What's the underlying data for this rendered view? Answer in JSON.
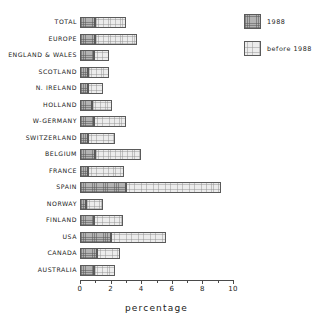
{
  "chart_data": {
    "type": "bar",
    "orientation": "horizontal",
    "stacked": true,
    "title": "",
    "subtitle": "",
    "xlabel": "percentage",
    "ylabel": "",
    "xlim": [
      0,
      10
    ],
    "ylim": null,
    "grid": false,
    "legend_position": "top-right",
    "x_major_ticks": [
      0,
      2,
      4,
      6,
      8,
      10
    ],
    "x_minor_ticks": [
      1,
      3,
      5,
      7,
      9
    ],
    "x_tick_labels": [
      "0",
      "2",
      "4",
      "6",
      "8",
      "10"
    ],
    "categories": [
      "TOTAL",
      "EUROPE",
      "ENGLAND & WALES",
      "SCOTLAND",
      "N. IRELAND",
      "HOLLAND",
      "W-GERMANY",
      "SWITZERLAND",
      "BELGIUM",
      "FRANCE",
      "SPAIN",
      "NORWAY",
      "FINLAND",
      "USA",
      "CANADA",
      "AUSTRALIA"
    ],
    "series": [
      {
        "name": "1988",
        "color": "#b3b3b3",
        "values": [
          1.0,
          1.0,
          0.9,
          0.5,
          0.5,
          0.8,
          0.9,
          0.5,
          1.0,
          0.5,
          3.0,
          0.4,
          0.9,
          2.0,
          1.1,
          0.9
        ]
      },
      {
        "name": "before 1988",
        "color": "#ececec",
        "values": [
          2.0,
          2.7,
          1.0,
          1.4,
          1.0,
          1.3,
          2.1,
          1.8,
          3.0,
          2.4,
          6.2,
          1.1,
          1.9,
          3.6,
          1.5,
          1.4
        ]
      }
    ],
    "totals": [
      3.0,
      3.7,
      1.9,
      1.9,
      1.5,
      2.1,
      3.0,
      2.3,
      4.0,
      2.9,
      9.2,
      1.5,
      2.8,
      5.6,
      2.6,
      2.3
    ]
  },
  "legend": {
    "entries": [
      {
        "label": "1988",
        "swatch": "recent"
      },
      {
        "label": "before 1988",
        "swatch": "before"
      }
    ]
  },
  "axis": {
    "x_title": "percentage"
  }
}
